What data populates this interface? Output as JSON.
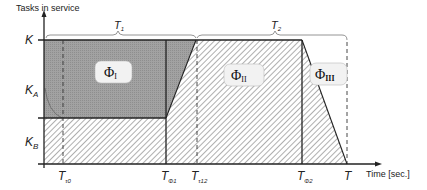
{
  "axes": {
    "y_label": "Tasks in service",
    "x_label": "Time [sec.]"
  },
  "y_ticks": {
    "K": "K",
    "KA_main": "K",
    "KA_sub": "A",
    "KB_main": "K",
    "KB_sub": "B"
  },
  "x_ticks": [
    {
      "main": "T",
      "sub": "τ0"
    },
    {
      "main": "T",
      "sub": "Φ1"
    },
    {
      "main": "T",
      "sub": "τ12"
    },
    {
      "main": "T",
      "sub": "Φ2"
    },
    {
      "main": "T",
      "sub": ""
    }
  ],
  "braces": [
    {
      "main": "T",
      "sub": "1"
    },
    {
      "main": "T",
      "sub": "2"
    }
  ],
  "phases": [
    {
      "main": "Φ",
      "sub": "I"
    },
    {
      "main": "Φ",
      "sub": "II"
    },
    {
      "main": "Φ",
      "sub": "III"
    }
  ],
  "colors": {
    "dark_fill": "#9a9a9a",
    "hatch_line": "#8c8c8c",
    "axis": "#222222",
    "label_box": "#f2f2f2"
  }
}
